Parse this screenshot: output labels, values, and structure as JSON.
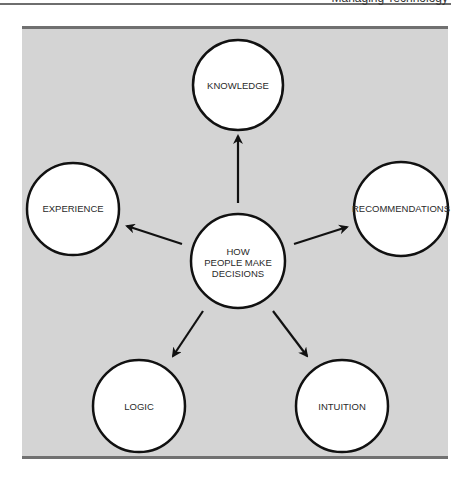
{
  "header": {
    "fragment": "Managing Technology"
  },
  "diagram": {
    "center": {
      "lines": [
        "HOW",
        "PEOPLE MAKE",
        "DECISIONS"
      ]
    },
    "nodes": [
      {
        "label": "KNOWLEDGE"
      },
      {
        "label": "EXPERIENCE"
      },
      {
        "label": "RECOMMENDATIONS"
      },
      {
        "label": "LOGIC"
      },
      {
        "label": "INTUITION"
      }
    ]
  },
  "colors": {
    "panel": "#d4d4d4",
    "rule": "#707070",
    "circle_fill": "#ffffff",
    "stroke": "#111111"
  }
}
